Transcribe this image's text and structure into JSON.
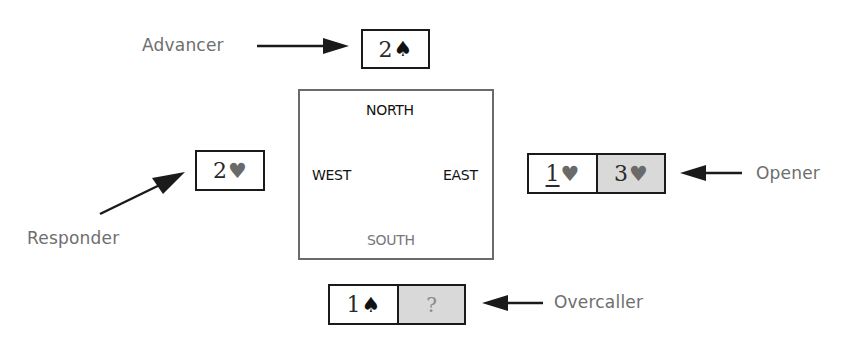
{
  "diagram": {
    "compass": {
      "north": "NORTH",
      "south": "SOUTH",
      "west": "WEST",
      "east": "EAST"
    },
    "roles": {
      "advancer": "Advancer",
      "responder": "Responder",
      "opener": "Opener",
      "overcaller": "Overcaller"
    },
    "bids": {
      "advancer": [
        {
          "level": "2",
          "suit": "♠",
          "suit_name": "spade",
          "shaded": false
        }
      ],
      "responder": [
        {
          "level": "2",
          "suit": "♥",
          "suit_name": "heart",
          "shaded": false
        }
      ],
      "opener": [
        {
          "level": "1",
          "suit": "♥",
          "suit_name": "heart",
          "shaded": false,
          "underlined": true
        },
        {
          "level": "3",
          "suit": "♥",
          "suit_name": "heart",
          "shaded": true
        }
      ],
      "overcaller": [
        {
          "level": "1",
          "suit": "♠",
          "suit_name": "spade",
          "shaded": false
        },
        {
          "level": "?",
          "suit": "",
          "suit_name": "unknown",
          "shaded": true
        }
      ]
    },
    "colors": {
      "box_border": "#1a1a1a",
      "shaded_fill": "#d9d9d9",
      "label_text": "#6e6e6e",
      "compass_border": "#6a6a6a",
      "heart": "#6a6a6a",
      "spade": "#111111"
    }
  }
}
